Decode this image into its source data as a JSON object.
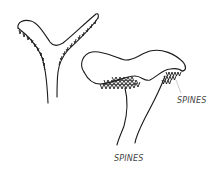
{
  "illustration": {
    "subject": "mushroom cross-section and side view with spines",
    "figures": [
      {
        "name": "y-section",
        "description": "Y-shaped vertical section with spines along underside"
      },
      {
        "name": "side-view",
        "description": "Cap side view with spines on underside and stem"
      }
    ],
    "labels": {
      "right_label": "SPINES",
      "bottom_label": "SPINES"
    },
    "colors": {
      "ink": "#1a1a1a",
      "label": "#444444",
      "background": "#ffffff"
    }
  }
}
